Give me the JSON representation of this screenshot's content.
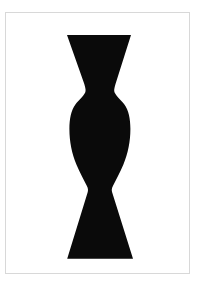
{
  "page": {
    "title": "Vase Silhouette",
    "background_color": "#ffffff",
    "frame_color": "#d8d8d8",
    "width": 197,
    "height": 286
  },
  "figure": {
    "name": "vase-silhouette",
    "fill_color": "#0a0a0a",
    "segments": [
      {
        "name": "top-flare",
        "shape": "trapezoid",
        "top_left_x": 67,
        "top_right_x": 131,
        "top_y": 35,
        "bottom_left_x": 85,
        "bottom_right_x": 114,
        "bottom_y": 92
      },
      {
        "name": "upper-neck",
        "shape": "waist",
        "y": 92,
        "left_x": 85,
        "right_x": 114,
        "width": 29
      },
      {
        "name": "bulb-body",
        "shape": "ellipse-lobe",
        "top_y": 92,
        "bottom_y": 190,
        "widest_y": 132,
        "left_x": 69,
        "right_x": 130,
        "max_width": 61
      },
      {
        "name": "lower-neck",
        "shape": "waist",
        "y": 190,
        "left_x": 85,
        "right_x": 114,
        "width": 29
      },
      {
        "name": "base-flare",
        "shape": "inverted-trapezoid",
        "top_left_x": 85,
        "top_right_x": 114,
        "top_y": 190,
        "bottom_left_x": 67,
        "bottom_right_x": 133,
        "bottom_y": 259
      }
    ]
  }
}
